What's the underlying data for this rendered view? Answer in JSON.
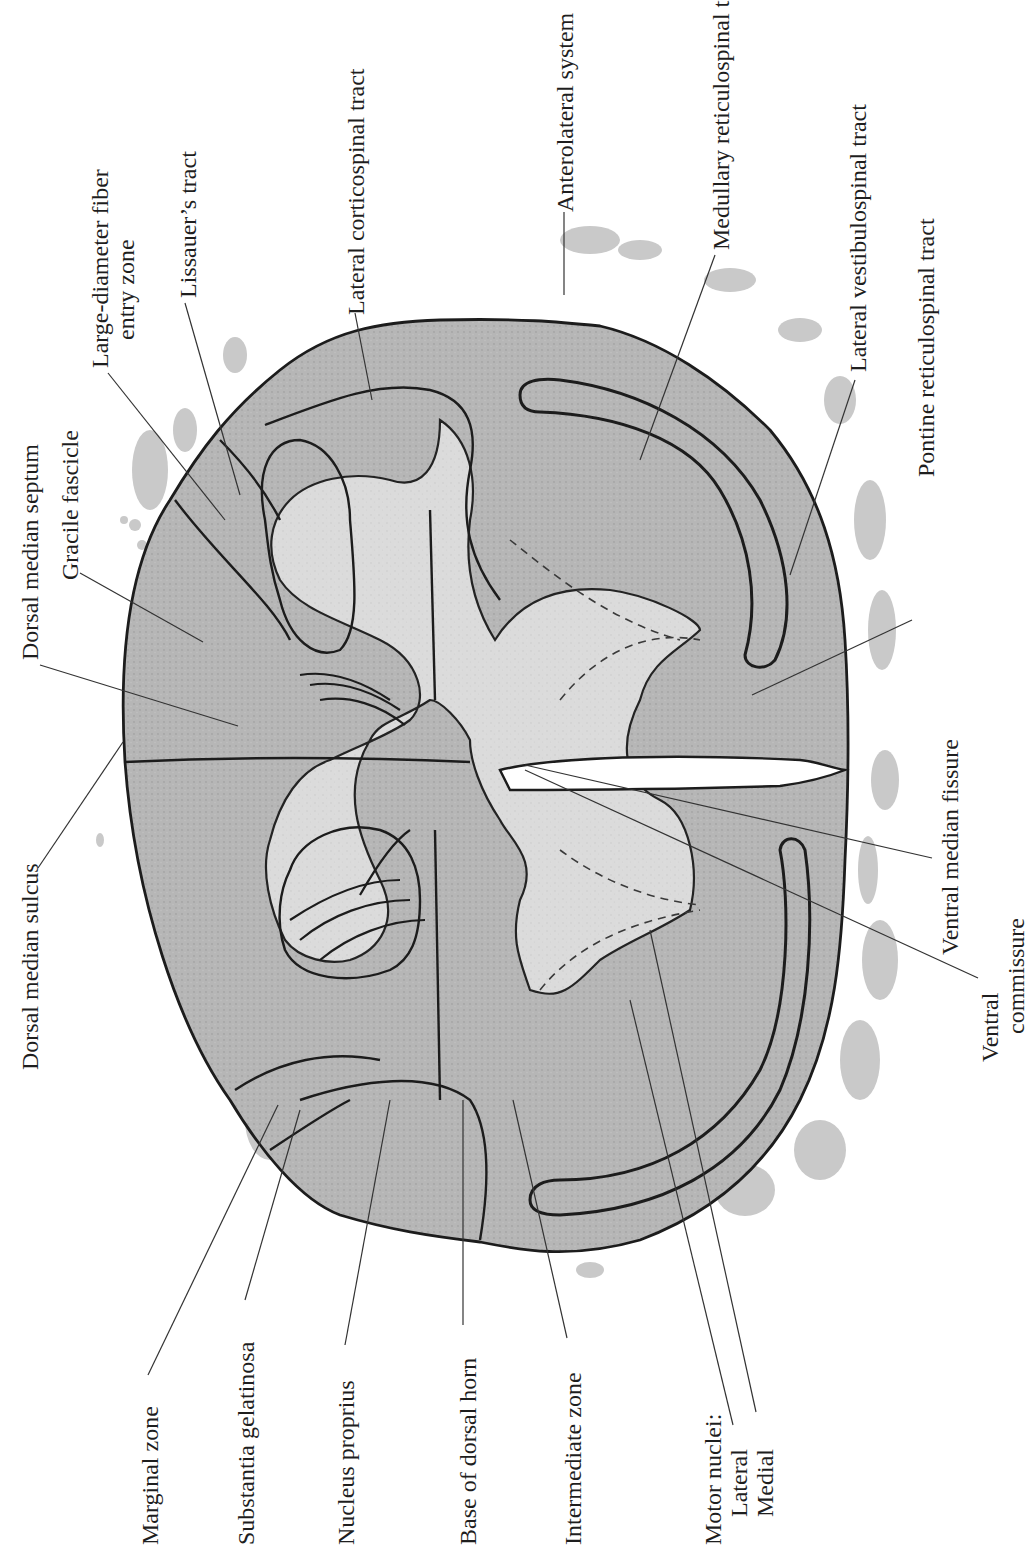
{
  "figure": {
    "type": "spinal cord transverse section (rotated 90°)",
    "colors": {
      "white_matter": "#b4b4b4",
      "gray_matter": "#dcdcdc",
      "outline": "#1c1c1c",
      "leader_line": "#333333",
      "rootlets": "#c8c8c8",
      "background": "#ffffff"
    }
  },
  "labels": {
    "large_diameter_fiber_entry_zone": {
      "line1": "Large-diameter fiber",
      "line2": "entry zone"
    },
    "lissauers_tract": "Lissauer’s tract",
    "lateral_corticospinal_tract": "Lateral corticospinal tract",
    "anterolateral_system": "Anterolateral system",
    "medullary_reticulospinal_tract": "Medullary reticulospinal tract",
    "lateral_vestibulospinal_tract": "Lateral vestibulospinal tract",
    "pontine_reticulospinal_tract": "Pontine reticulospinal tract",
    "dorsal_median_septum": "Dorsal median septum",
    "gracile_fascicle": "Gracile fascicle",
    "dorsal_median_sulcus": "Dorsal median sulcus",
    "ventral_median_fissure": "Ventral median fissure",
    "ventral_commissure": {
      "line1": "Ventral",
      "line2": "commissure"
    },
    "marginal_zone": "Marginal zone",
    "substantia_gelatinosa": "Substantia gelatinosa",
    "nucleus_proprius": "Nucleus proprius",
    "base_of_dorsal_horn": "Base of dorsal horn",
    "intermediate_zone": "Intermediate zone",
    "motor_nuclei": {
      "heading": "Motor nuclei:",
      "lateral": "Lateral",
      "medial": "Medial"
    }
  }
}
